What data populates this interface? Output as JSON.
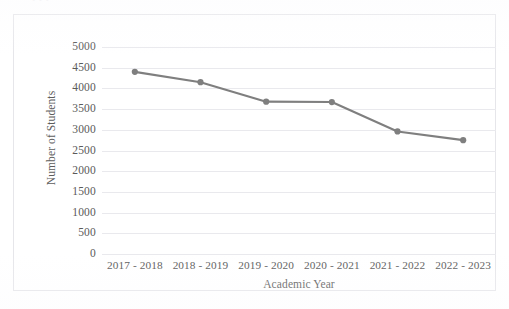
{
  "page": {
    "top_remnant_text": "• • •"
  },
  "chart_data": {
    "type": "line",
    "title": "",
    "xlabel": "Academic Year",
    "ylabel": "Number of Students",
    "categories": [
      "2017 - 2018",
      "2018 - 2019",
      "2019 - 2020",
      "2020 - 2021",
      "2021 - 2022",
      "2022 - 2023"
    ],
    "values": [
      4400,
      4150,
      3680,
      3670,
      2960,
      2750
    ],
    "series": [
      {
        "name": "Number of Students",
        "values": [
          4400,
          4150,
          3680,
          3670,
          2960,
          2750
        ]
      }
    ],
    "ylim": [
      0,
      5000
    ],
    "ytick_values": [
      0,
      500,
      1000,
      1500,
      2000,
      2500,
      3000,
      3500,
      4000,
      4500,
      5000
    ],
    "ytick_labels": [
      "0",
      "500",
      "1000",
      "1500",
      "2000",
      "2500",
      "3000",
      "3500",
      "4000",
      "4500",
      "5000"
    ],
    "grid": "horizontal",
    "legend": "none",
    "line_color": "#7f7f7f",
    "marker_color": "#7f7f7f",
    "marker_shape": "circle",
    "gridline_color": "#e9e9ed",
    "frame_color": "#e6e6ea",
    "text_color": "#5a5a5a"
  }
}
